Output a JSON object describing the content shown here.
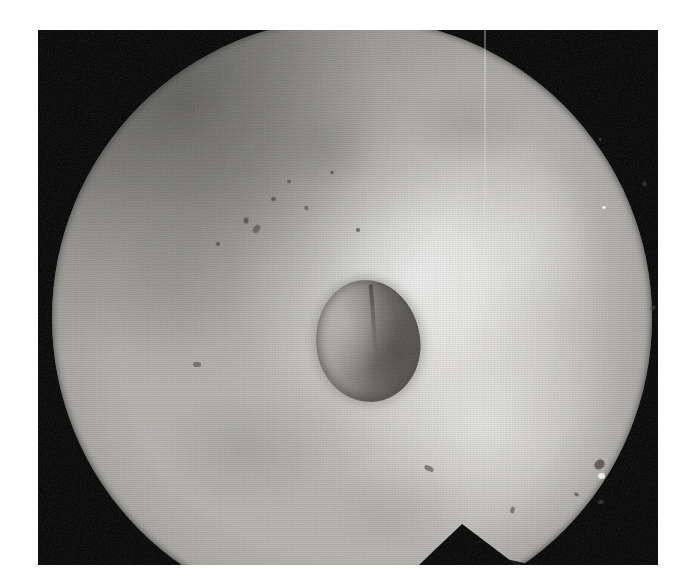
{
  "figure": {
    "kind": "photograph",
    "modality": "endoscopic-grayscale-photograph",
    "subject": "otoscopic view of tympanic membrane with central perforation",
    "caption": "",
    "label": "",
    "colors": {
      "page_background": "#ffffff",
      "frame_border": "#060606",
      "field_base": "#b9b7b2",
      "field_highlight": "#ffffff",
      "field_shadow": "#3a3937",
      "lesion_light": "#b0aeaa",
      "lesion_dark": "#5c5a57",
      "notch": "#060606"
    },
    "geometry": {
      "canvas_width": 694,
      "canvas_height": 587,
      "frame_left": 38,
      "frame_top": 30,
      "frame_width": 620,
      "frame_height": 535,
      "field_center_x": 314,
      "field_center_y": 288,
      "field_radius": 300
    }
  },
  "regions": {
    "illuminated_field": {
      "name": "circular illuminated field",
      "description": "Bright near-circular endoscopic light field filling most of the black frame; top of the disc is clipped by the frame edge."
    },
    "central_lesion": {
      "name": "central ovoid perforation",
      "description": "Dark rounded-oval defect near the centre; left half mid-grey, right half markedly darker with a faint vertical ridge.",
      "center_x": 330,
      "center_y": 311,
      "width": 104,
      "height": 122
    },
    "bottom_notch": {
      "name": "triangular shadow notch",
      "description": "Dark triangular wedge intruding into the lower field boundary, apex pointing upward.",
      "apex_x": 464,
      "apex_y": 524
    },
    "specular_highlight": {
      "name": "specular highlight",
      "description": "Brightest light reflex in the upper-right quadrant of the field.",
      "center_x": 500,
      "center_y": 275
    },
    "vignette": {
      "name": "upper-left shading",
      "description": "Graded darkening of the mucosal surface toward the upper-left rim."
    }
  },
  "markers": {
    "specks": [
      {
        "x": 205,
        "y": 188,
        "w": 6,
        "h": 5,
        "style": "blur"
      },
      {
        "x": 214,
        "y": 196,
        "w": 9,
        "h": 6,
        "style": "smear"
      },
      {
        "x": 233,
        "y": 167,
        "w": 5,
        "h": 4,
        "style": "blur"
      },
      {
        "x": 249,
        "y": 150,
        "w": 4,
        "h": 3,
        "style": "blur"
      },
      {
        "x": 266,
        "y": 176,
        "w": 5,
        "h": 4,
        "style": "smear"
      },
      {
        "x": 178,
        "y": 212,
        "w": 4,
        "h": 4,
        "style": "blur"
      },
      {
        "x": 292,
        "y": 141,
        "w": 4,
        "h": 3,
        "style": "blur"
      },
      {
        "x": 318,
        "y": 198,
        "w": 4,
        "h": 4,
        "style": "blur"
      },
      {
        "x": 386,
        "y": 436,
        "w": 10,
        "h": 5,
        "style": "smear"
      },
      {
        "x": 437,
        "y": 506,
        "w": 5,
        "h": 4,
        "style": "blur"
      },
      {
        "x": 471,
        "y": 478,
        "w": 7,
        "h": 4,
        "style": "smear"
      },
      {
        "x": 556,
        "y": 430,
        "w": 11,
        "h": 9,
        "style": "blur"
      },
      {
        "x": 560,
        "y": 470,
        "w": 6,
        "h": 4,
        "style": "smear"
      },
      {
        "x": 536,
        "y": 463,
        "w": 5,
        "h": 3,
        "style": "blur"
      },
      {
        "x": 604,
        "y": 152,
        "w": 5,
        "h": 4,
        "style": "blur"
      },
      {
        "x": 560,
        "y": 108,
        "w": 4,
        "h": 3,
        "style": "blur"
      },
      {
        "x": 612,
        "y": 276,
        "w": 6,
        "h": 4,
        "style": "smear"
      },
      {
        "x": 155,
        "y": 332,
        "w": 8,
        "h": 5,
        "style": "smear"
      }
    ],
    "highlights": [
      {
        "x": 560,
        "y": 443,
        "w": 7,
        "h": 6
      },
      {
        "x": 564,
        "y": 176,
        "w": 4,
        "h": 3
      }
    ]
  }
}
